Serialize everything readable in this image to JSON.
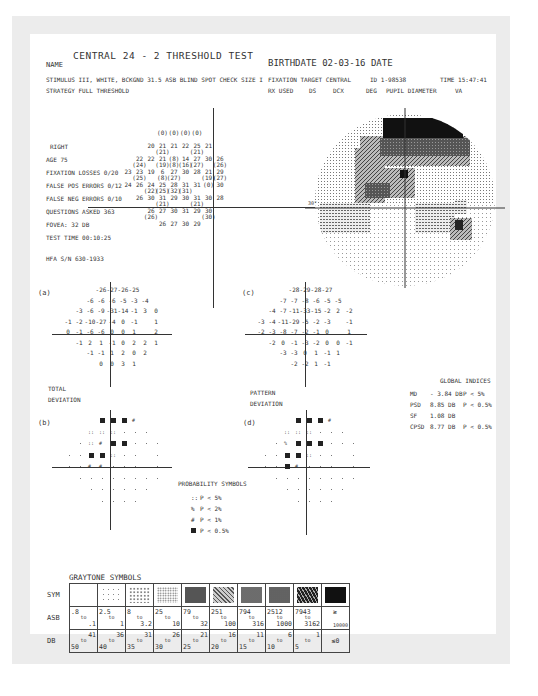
{
  "header": {
    "title": "CENTRAL 24 - 2 THRESHOLD TEST",
    "name_label": "NAME",
    "birthdate": "BIRTHDATE  02-03-16 DATE",
    "stimulus": "STIMULUS  III, WHITE, BCKGND 31.5 ASB  BLIND SPOT CHECK SIZE  I",
    "strategy": "STRATEGY  FULL THRESHOLD",
    "fixation_target": "FIXATION TARGET   CENTRAL",
    "id": "ID  1-98538",
    "time": "TIME  15:47:41",
    "rx_used": "RX USED",
    "ds": "DS",
    "dcx": "DCX",
    "deg": "DEG",
    "pupil": "PUPIL DIAMETER",
    "va": "VA"
  },
  "reliability": {
    "eye": "RIGHT",
    "age": "AGE       75",
    "fixation_losses": "FIXATION LOSSES   0/20",
    "false_pos": "FALSE POS ERRORS  0/12",
    "false_neg": "FALSE NEG ERRORS  0/10",
    "questions": "QUESTIONS ASKED   363",
    "fovea": "FOVEA: 32 DB",
    "test_time": "TEST TIME 00:10:25",
    "hfa": "HFA S/N  630-1933"
  },
  "threshold_rows": [
    {
      "y": 0,
      "vals": [
        [
          "",
          "(0)"
        ],
        [
          "",
          "(0)"
        ],
        [
          "",
          "(0)"
        ],
        [
          "",
          "(0)"
        ]
      ],
      "start": 3
    },
    {
      "y": 1,
      "vals": [
        [
          "20",
          ""
        ],
        [
          "21",
          "(21)"
        ],
        [
          "21",
          ""
        ],
        [
          "22",
          ""
        ],
        [
          "25",
          "(21)"
        ],
        [
          "21",
          ""
        ]
      ],
      "start": 2
    },
    {
      "y": 2,
      "vals": [
        [
          "22",
          "(24)"
        ],
        [
          "22",
          ""
        ],
        [
          "21",
          "(19)"
        ],
        [
          "(8)",
          "(8)"
        ],
        [
          "14",
          "(16)"
        ],
        [
          "27",
          "(27)"
        ],
        [
          "30",
          ""
        ],
        [
          "26",
          "(26)"
        ]
      ],
      "start": 1
    },
    {
      "y": 3,
      "vals": [
        [
          "23",
          ""
        ],
        [
          "23",
          "(25)"
        ],
        [
          "19",
          ""
        ],
        [
          "6",
          "(8)"
        ],
        [
          "27",
          "(27)"
        ],
        [
          "30",
          ""
        ],
        [
          "28",
          ""
        ],
        [
          "21",
          "(19)"
        ],
        [
          "29",
          "(27)"
        ]
      ],
      "start": 0
    },
    {
      "y": 4,
      "vals": [
        [
          "24",
          ""
        ],
        [
          "26",
          ""
        ],
        [
          "24",
          "(22)"
        ],
        [
          "25",
          "(25)"
        ],
        [
          "28",
          "(32)"
        ],
        [
          "31",
          "(31)"
        ],
        [
          "31",
          ""
        ],
        [
          "(0)",
          ""
        ],
        [
          "30",
          ""
        ]
      ],
      "start": 0
    },
    {
      "y": 5,
      "vals": [
        [
          "26",
          ""
        ],
        [
          "30",
          ""
        ],
        [
          "31",
          "(21)"
        ],
        [
          "29",
          ""
        ],
        [
          "30",
          ""
        ],
        [
          "31",
          "(21)"
        ],
        [
          "30",
          ""
        ],
        [
          "28",
          ""
        ]
      ],
      "start": 1
    },
    {
      "y": 6,
      "vals": [
        [
          "26",
          "(26)"
        ],
        [
          "27",
          ""
        ],
        [
          "30",
          ""
        ],
        [
          "31",
          ""
        ],
        [
          "29",
          ""
        ],
        [
          "30",
          "(30)"
        ]
      ],
      "start": 2
    },
    {
      "y": 7,
      "vals": [
        [
          "26",
          ""
        ],
        [
          "27",
          ""
        ],
        [
          "30",
          ""
        ],
        [
          "29",
          ""
        ]
      ],
      "start": 3
    }
  ],
  "map_label": "30°",
  "total_deviation": {
    "label_a": "(a)",
    "title1": "TOTAL",
    "title2": "DEVIATION",
    "rows": [
      {
        "start": 3,
        "vals": [
          "-26",
          "-27",
          "-26",
          "-25"
        ]
      },
      {
        "start": 2,
        "vals": [
          "-6",
          "-6",
          "-6",
          "-5",
          "-3",
          "-4"
        ]
      },
      {
        "start": 1,
        "vals": [
          "-3",
          "-6",
          "-9",
          "-31",
          "-14",
          "-1",
          "3",
          "0"
        ]
      },
      {
        "start": 0,
        "vals": [
          "-1",
          "-2",
          "-10",
          "-27",
          "-4",
          "0",
          "-1",
          "",
          "1"
        ]
      },
      {
        "start": 0,
        "vals": [
          "0",
          "-1",
          "-6",
          "-6",
          "0",
          "0",
          "1",
          "",
          "2"
        ]
      },
      {
        "start": 1,
        "vals": [
          "-1",
          "2",
          "1",
          "-1",
          "0",
          "2",
          "2",
          "1"
        ]
      },
      {
        "start": 2,
        "vals": [
          "-1",
          "-1",
          "1",
          "2",
          "0",
          "2"
        ]
      },
      {
        "start": 3,
        "vals": [
          "0",
          "0",
          "3",
          "1"
        ]
      }
    ]
  },
  "pattern_deviation": {
    "label_c": "(c)",
    "title1": "PATTERN",
    "title2": "DEVIATION",
    "rows": [
      {
        "start": 3,
        "vals": [
          "-28",
          "-29",
          "-28",
          "-27"
        ]
      },
      {
        "start": 2,
        "vals": [
          "-7",
          "-7",
          "-8",
          "-6",
          "-5",
          "-5"
        ]
      },
      {
        "start": 1,
        "vals": [
          "-4",
          "-7",
          "-11",
          "-33",
          "-15",
          "-2",
          "2",
          "-2"
        ]
      },
      {
        "start": 0,
        "vals": [
          "-3",
          "-4",
          "-11",
          "-29",
          "-5",
          "-2",
          "-3",
          "",
          "-1"
        ]
      },
      {
        "start": 0,
        "vals": [
          "-2",
          "-3",
          "-8",
          "-7",
          "-2",
          "-1",
          "0",
          "",
          "1"
        ]
      },
      {
        "start": 1,
        "vals": [
          "-2",
          "0",
          "-1",
          "-3",
          "-2",
          "0",
          "0",
          "-1"
        ]
      },
      {
        "start": 2,
        "vals": [
          "-3",
          "-3",
          "0",
          "1",
          "-1",
          "1"
        ]
      },
      {
        "start": 3,
        "vals": [
          "-2",
          "-2",
          "1",
          "-1"
        ]
      }
    ]
  },
  "prob_b": {
    "label": "(b)",
    "rows": [
      {
        "start": 3,
        "vals": [
          "sq",
          "sq",
          "sq",
          "p1"
        ]
      },
      {
        "start": 2,
        "vals": [
          "p5",
          "p5",
          "p5",
          "d",
          "d",
          "d"
        ]
      },
      {
        "start": 1,
        "vals": [
          "d",
          "p5",
          "p1",
          "sq",
          "sq",
          "d",
          "d",
          "d"
        ]
      },
      {
        "start": 0,
        "vals": [
          "d",
          "d",
          "sq",
          "sq",
          "p5",
          "d",
          "d",
          "",
          "d"
        ]
      },
      {
        "start": 0,
        "vals": [
          "d",
          "d",
          "p1",
          "p1",
          "d",
          "d",
          "d",
          "",
          "d"
        ]
      },
      {
        "start": 1,
        "vals": [
          "d",
          "d",
          "d",
          "d",
          "d",
          "d",
          "d",
          "d"
        ]
      },
      {
        "start": 2,
        "vals": [
          "d",
          "d",
          "d",
          "d",
          "d",
          "d"
        ]
      },
      {
        "start": 3,
        "vals": [
          "d",
          "d",
          "d",
          "d"
        ]
      }
    ]
  },
  "prob_d": {
    "label": "(d)",
    "rows": [
      {
        "start": 3,
        "vals": [
          "sq",
          "sq",
          "sq",
          "p1"
        ]
      },
      {
        "start": 2,
        "vals": [
          "p5",
          "p5",
          "p5",
          "d",
          "d",
          "d"
        ]
      },
      {
        "start": 1,
        "vals": [
          "d",
          "p2",
          "sq",
          "sq",
          "sq",
          "d",
          "d",
          "d"
        ]
      },
      {
        "start": 0,
        "vals": [
          "d",
          "d",
          "sq",
          "sq",
          "p5",
          "d",
          "d",
          "",
          "d"
        ]
      },
      {
        "start": 0,
        "vals": [
          "d",
          "d",
          "sq",
          "p1",
          "d",
          "d",
          "d",
          "",
          "d"
        ]
      },
      {
        "start": 1,
        "vals": [
          "d",
          "d",
          "d",
          "d",
          "d",
          "d",
          "d",
          "d"
        ]
      },
      {
        "start": 2,
        "vals": [
          "d",
          "d",
          "d",
          "d",
          "d",
          "d"
        ]
      },
      {
        "start": 3,
        "vals": [
          "d",
          "d",
          "d",
          "d"
        ]
      }
    ]
  },
  "probability_symbols": {
    "title": "PROBABILITY SYMBOLS",
    "items": [
      {
        "sym": "::",
        "text": "P <  5%"
      },
      {
        "sym": "%",
        "text": "P <  2%"
      },
      {
        "sym": "#",
        "text": "P <  1%"
      },
      {
        "sym": "■",
        "text": "P < 0.5%"
      }
    ]
  },
  "global_indices": {
    "title": "GLOBAL INDICES",
    "rows": [
      {
        "k": "MD",
        "v": "- 3.84 DB",
        "p": "P <  5%"
      },
      {
        "k": "PSD",
        "v": "8.85 DB",
        "p": "P < 0.5%"
      },
      {
        "k": "SF",
        "v": "1.08 DB",
        "p": ""
      },
      {
        "k": "CPSD",
        "v": "8.77 DB",
        "p": "P < 0.5%"
      }
    ]
  },
  "graytone": {
    "title": "GRAYTONE SYMBOLS",
    "row_labels": [
      "SYM",
      "ASB",
      "DB"
    ],
    "asb": [
      [
        ".8",
        ".1"
      ],
      [
        "2.5",
        "1"
      ],
      [
        "8",
        "3.2"
      ],
      [
        "25",
        "10"
      ],
      [
        "79",
        "32"
      ],
      [
        "251",
        "100"
      ],
      [
        "794",
        "316"
      ],
      [
        "2512",
        "1000"
      ],
      [
        "7943",
        "3162"
      ],
      [
        "≥",
        "10000"
      ]
    ],
    "db": [
      [
        "50",
        "41"
      ],
      [
        "40",
        "36"
      ],
      [
        "35",
        "31"
      ],
      [
        "30",
        "26"
      ],
      [
        "25",
        "21"
      ],
      [
        "20",
        "16"
      ],
      [
        "15",
        "11"
      ],
      [
        "10",
        "6"
      ],
      [
        "5",
        "1"
      ],
      [
        "",
        "≤0"
      ]
    ]
  }
}
